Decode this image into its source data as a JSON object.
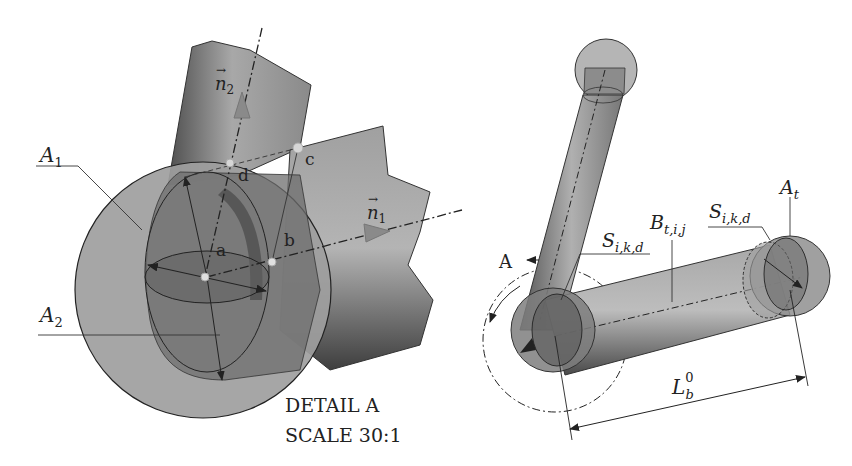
{
  "diagram": {
    "left_view": {
      "title": "DETAIL A",
      "scale": "SCALE 30:1",
      "labels": {
        "sphere_outer": "A",
        "sphere_outer_sub": "1",
        "sphere_inner": "A",
        "sphere_inner_sub": "2",
        "normal_1": "n",
        "normal_1_sub": "1",
        "normal_2": "n",
        "normal_2_sub": "2",
        "point_a": "a",
        "point_b": "b",
        "point_c": "c",
        "point_d": "d"
      }
    },
    "right_view": {
      "labels": {
        "detail_ref": "A",
        "strut_left_label": "S",
        "strut_left_sub": "i,k,d",
        "strut_beam": "B",
        "strut_beam_sub": "t,i,j",
        "strut_right_label": "S",
        "strut_right_sub": "i,k,d",
        "node_label": "A",
        "node_sub": "t",
        "length_label": "L",
        "length_sub": "b",
        "length_sup": "0"
      }
    },
    "colors": {
      "background": "#ffffff",
      "shape_light": "#b8b8b8",
      "shape_mid": "#8f8f8f",
      "shape_dark": "#5a5a5a",
      "line": "#2a2a2a"
    }
  }
}
